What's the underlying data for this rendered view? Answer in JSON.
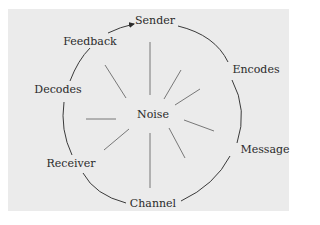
{
  "diagram": {
    "center": {
      "label": "Noise"
    },
    "nodes": [
      {
        "id": "sender",
        "label": "Sender"
      },
      {
        "id": "encodes",
        "label": "Encodes"
      },
      {
        "id": "message",
        "label": "Message"
      },
      {
        "id": "channel",
        "label": "Channel"
      },
      {
        "id": "receiver",
        "label": "Receiver"
      },
      {
        "id": "decodes",
        "label": "Decodes"
      },
      {
        "id": "feedback",
        "label": "Feedback"
      }
    ],
    "edges": [
      {
        "from": "sender",
        "to": "encodes"
      },
      {
        "from": "encodes",
        "to": "message"
      },
      {
        "from": "message",
        "to": "channel"
      },
      {
        "from": "channel",
        "to": "receiver"
      },
      {
        "from": "receiver",
        "to": "decodes"
      },
      {
        "from": "decodes",
        "to": "feedback"
      },
      {
        "from": "feedback",
        "to": "sender",
        "arrow": true
      }
    ],
    "colors": {
      "background": "#ebebeb",
      "line": "#3a3a3a",
      "ray": "#6a6a6a",
      "text": "#2a2a2a"
    }
  }
}
